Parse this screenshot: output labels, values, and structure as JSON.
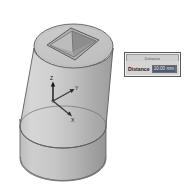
{
  "app": {
    "title": "CAD 3D Modeling Viewport",
    "background_color": "#ffffff"
  },
  "viewport": {
    "name": "3d-viewport",
    "model": {
      "name": "truncated-cone-with-square-pyramid-pocket",
      "description": "Shaded 3D solid: a conical frustum sitting on a short cylindrical base, with a square pyramidal pocket cut into the top circular face",
      "shading": "flat-gray-shaded",
      "colors": {
        "face_light": "#cfcfcf",
        "face_mid": "#bdbdbd",
        "face_dark": "#a6a6a6",
        "face_darker": "#959595",
        "top_face": "#c4c4c4",
        "pocket_left": "#b4b4b4",
        "pocket_right": "#8f8f8f",
        "outline": "#5b5b5b"
      }
    },
    "triad": {
      "name": "coordinate-triad",
      "axes": [
        {
          "id": "z-axis",
          "label": "Z",
          "direction": "up"
        },
        {
          "id": "y-axis",
          "label": "Y",
          "direction": "upper-right"
        },
        {
          "id": "x-axis",
          "label": "X",
          "direction": "lower-right"
        }
      ],
      "arrow_color": "#1a1a1a"
    }
  },
  "dialog": {
    "name": "distance-dialog",
    "title": "Distance",
    "label": "Distance",
    "value": "10.00 mm",
    "spinner_up": "▲",
    "spinner_down": "▼",
    "colors": {
      "chrome": "#d4d4d4",
      "border": "#5a5a5a",
      "selection": "#4a5a78"
    }
  }
}
